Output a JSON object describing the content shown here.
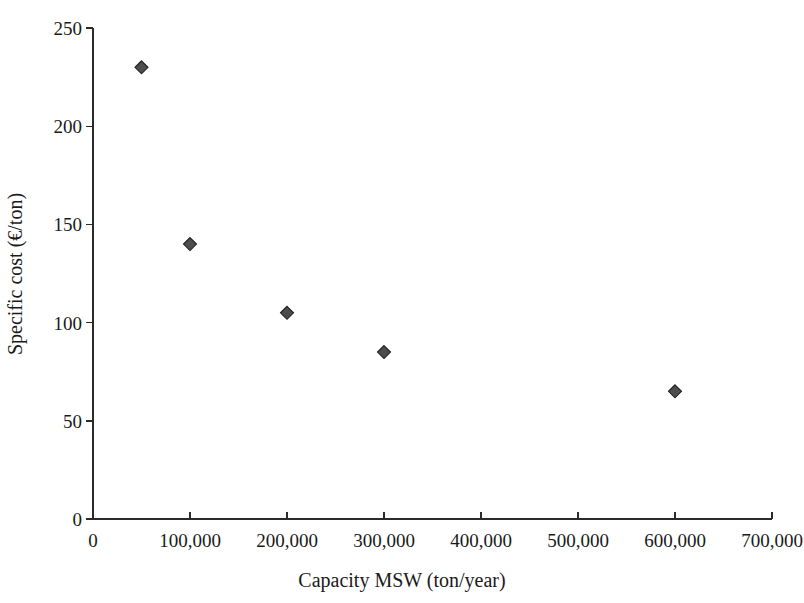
{
  "chart_data": {
    "type": "scatter",
    "title": "",
    "xlabel": "Capacity MSW (ton/year)",
    "ylabel": "Specific cost (€/ton)",
    "xlim": [
      0,
      700000
    ],
    "ylim": [
      0,
      250
    ],
    "grid": false,
    "legend": "none",
    "marker": {
      "shape": "diamond",
      "fill_color": "#4d4d4d",
      "edge_color": "#1f1f1f",
      "size_px": 13
    },
    "xticks": [
      0,
      100000,
      200000,
      300000,
      400000,
      500000,
      600000,
      700000
    ],
    "xtick_labels": [
      "0",
      "100,000",
      "200,000",
      "300,000",
      "400,000",
      "500,000",
      "600,000",
      "700,000"
    ],
    "yticks": [
      0,
      50,
      100,
      150,
      200,
      250
    ],
    "ytick_labels": [
      "0",
      "50",
      "100",
      "150",
      "200",
      "250"
    ],
    "x": [
      50000,
      100000,
      200000,
      300000,
      600000
    ],
    "y": [
      230,
      140,
      105,
      85,
      65
    ],
    "points": [
      {
        "x": 50000,
        "y": 230
      },
      {
        "x": 100000,
        "y": 140
      },
      {
        "x": 200000,
        "y": 105
      },
      {
        "x": 300000,
        "y": 85
      },
      {
        "x": 600000,
        "y": 65
      }
    ],
    "series": [
      {
        "name": "Specific cost vs capacity",
        "x": [
          50000,
          100000,
          200000,
          300000,
          600000
        ],
        "values": [
          230,
          140,
          105,
          85,
          65
        ]
      }
    ]
  },
  "axes": {
    "x_title": "Capacity MSW (ton/year)",
    "y_title": "Specific cost (€/ton)"
  },
  "colors": {
    "axis": "#2b2b2b",
    "marker_fill": "#4d4d4d",
    "marker_edge": "#1f1f1f",
    "text": "#1a1a1a",
    "background": "#ffffff"
  }
}
